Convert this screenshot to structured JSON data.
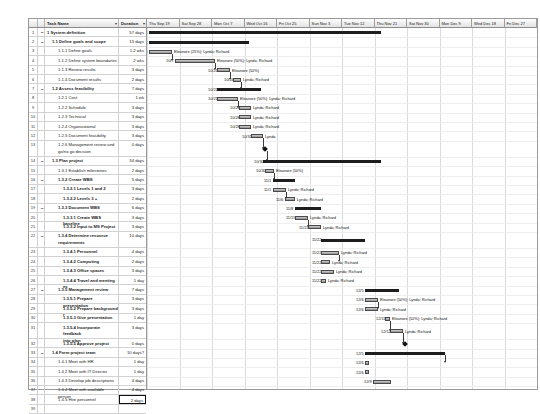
{
  "columns": {
    "id": "",
    "name": "Task Name",
    "duration": "Duration",
    "filter_icon": "▾"
  },
  "timeline": {
    "headers": [
      "Thu Sep 19",
      "Sat Sep 28",
      "Mon Oct 7",
      "Wed Oct 16",
      "Fri Oct 25",
      "Sun Nov 3",
      "Tue Nov 12",
      "Thu Nov 21",
      "Sat Nov 30",
      "Mon Dec 9",
      "Wed Dec 18",
      "Fri Dec 27"
    ]
  },
  "selected_row": 38,
  "tasks": [
    {
      "id": "1",
      "name": "1 System definition",
      "duration": "57 days",
      "level": 1,
      "summary": true,
      "collapse": true
    },
    {
      "id": "2",
      "name": "1.1 Define goals and scope",
      "duration": "15 days",
      "level": 2,
      "summary": true,
      "collapse": true
    },
    {
      "id": "3",
      "name": "1.1.1 Define goals",
      "duration": "1.2 wks",
      "level": 3
    },
    {
      "id": "4",
      "name": "1.1.2 Define system boundaries",
      "duration": "2 wks",
      "level": 3
    },
    {
      "id": "5",
      "name": "1.1.3 Review results",
      "duration": "3 days",
      "level": 3
    },
    {
      "id": "6",
      "name": "1.1.4 Document results",
      "duration": "2 days",
      "level": 3
    },
    {
      "id": "7",
      "name": "1.2 Assess feasibility",
      "duration": "7 days",
      "level": 2,
      "summary": true,
      "collapse": true
    },
    {
      "id": "8",
      "name": "1.2.1 Cost",
      "duration": "1 wk",
      "level": 3
    },
    {
      "id": "9",
      "name": "1.2.2 Schedule",
      "duration": "3 days",
      "level": 3
    },
    {
      "id": "10",
      "name": "1.2.3 Technical",
      "duration": "3 days",
      "level": 3
    },
    {
      "id": "11",
      "name": "1.2.4 Organizational",
      "duration": "3 days",
      "level": 3
    },
    {
      "id": "12",
      "name": "1.2.5 Document feasibility",
      "duration": "3 days",
      "level": 3
    },
    {
      "id": "13",
      "name": "1.2.6 Management review and\ngo/no go decision",
      "duration": "0 days",
      "level": 3,
      "tall": true
    },
    {
      "id": "14",
      "name": "1.3 Plan project",
      "duration": "34 days",
      "level": 2,
      "summary": true,
      "collapse": true
    },
    {
      "id": "15",
      "name": "1.3.1 Establish milestones",
      "duration": "2 days",
      "level": 3
    },
    {
      "id": "16",
      "name": "1.3.2 Create WBS",
      "duration": "5 days",
      "level": 3,
      "summary": true,
      "collapse": true
    },
    {
      "id": "17",
      "name": "1.3.2.1 Levels 1 and 2",
      "duration": "3 days",
      "level": 4
    },
    {
      "id": "18",
      "name": "1.3.2.2 Levels 3 +",
      "duration": "2 days",
      "level": 4
    },
    {
      "id": "19",
      "name": "1.3.3 Document WBS",
      "duration": "6 days",
      "level": 3,
      "summary": true,
      "collapse": true
    },
    {
      "id": "20",
      "name": "1.3.3.1 Create WBS baseline",
      "duration": "3 days",
      "level": 4
    },
    {
      "id": "21",
      "name": "1.3.3.2 Input to MS Project",
      "duration": "3 days",
      "level": 4
    },
    {
      "id": "22",
      "name": "1.3.4 Determine resource\nrequirements",
      "duration": "10 days",
      "level": 3,
      "summary": true,
      "collapse": true,
      "tall": true
    },
    {
      "id": "23",
      "name": "1.3.4.1 Personnel",
      "duration": "4 days",
      "level": 4
    },
    {
      "id": "24",
      "name": "1.3.4.2 Computing",
      "duration": "2 days",
      "level": 4
    },
    {
      "id": "25",
      "name": "1.3.4.3 Office spaces",
      "duration": "3 days",
      "level": 4
    },
    {
      "id": "26",
      "name": "1.3.4.4 Travel and meeting ex",
      "duration": "1 day",
      "level": 4
    },
    {
      "id": "27",
      "name": "1.3.5 Management review",
      "duration": "7 days",
      "level": 3,
      "summary": true,
      "collapse": true
    },
    {
      "id": "28",
      "name": "1.3.5.1 Prepare presentation",
      "duration": "3 days",
      "level": 4
    },
    {
      "id": "29",
      "name": "1.3.5.2 Prepare background r",
      "duration": "3 days",
      "level": 4
    },
    {
      "id": "30",
      "name": "1.3.5.3 Give presentation",
      "duration": "1 day",
      "level": 4
    },
    {
      "id": "31",
      "name": "1.3.5.4 Incorporate feedback\ninto plan",
      "duration": "3 days",
      "level": 4,
      "tall": true
    },
    {
      "id": "32",
      "name": "1.3.5.5 Approve project",
      "duration": "0 days",
      "level": 4
    },
    {
      "id": "33",
      "name": "1.4 Form project team",
      "duration": "10 days?",
      "level": 2,
      "summary": true,
      "collapse": true
    },
    {
      "id": "34",
      "name": "1.4.1 Meet with HR",
      "duration": "1 day",
      "level": 3
    },
    {
      "id": "35",
      "name": "1.4.2 Meet with IT Director",
      "duration": "1 day",
      "level": 3
    },
    {
      "id": "36",
      "name": "1.4.3 Develop job descriptions",
      "duration": "4 days",
      "level": 3
    },
    {
      "id": "37",
      "name": "1.4.4 Meet with available person",
      "duration": "4 days",
      "level": 3
    },
    {
      "id": "38",
      "name": "1.4.5 Hire personnel",
      "duration": "2 days",
      "level": 3,
      "selected": true
    },
    {
      "id": "39",
      "name": "",
      "duration": "",
      "level": 3
    }
  ],
  "bars": [
    {
      "row": 0,
      "type": "summary",
      "x": 2,
      "w": 232,
      "start": "10/1"
    },
    {
      "row": 1,
      "type": "summary",
      "x": 2,
      "w": 100,
      "start": "10/1"
    },
    {
      "row": 2,
      "type": "bar",
      "x": 2,
      "w": 23,
      "start": "10/1",
      "resources": "Eleanore (25%); Lynda; Richard"
    },
    {
      "row": 3,
      "type": "bar",
      "x": 28,
      "w": 40,
      "start": "10/7",
      "resources": "Eleanore (50%); Lynda; Richard"
    },
    {
      "row": 4,
      "type": "bar",
      "x": 70,
      "w": 13,
      "start": "10/21",
      "resources": "Eleanore (50%)"
    },
    {
      "row": 5,
      "type": "bar",
      "x": 86,
      "w": 8,
      "start": "10/24",
      "resources": "Lynda; Richard"
    },
    {
      "row": 6,
      "type": "summary",
      "x": 70,
      "w": 44,
      "start": "10/21"
    },
    {
      "row": 7,
      "type": "bar",
      "x": 70,
      "w": 21,
      "start": "10/21",
      "resources": "Eleanore (50%); Lynda; Richard"
    },
    {
      "row": 8,
      "type": "bar",
      "x": 92,
      "w": 12,
      "start": "10/28",
      "resources": "Lynda; Richard"
    },
    {
      "row": 9,
      "type": "bar",
      "x": 92,
      "w": 12,
      "start": "10/28",
      "resources": "Lynda; Richard"
    },
    {
      "row": 10,
      "type": "bar",
      "x": 92,
      "w": 12,
      "start": "10/28",
      "resources": "Lynda; Richard"
    },
    {
      "row": 11,
      "type": "bar",
      "x": 104,
      "w": 12,
      "start": "10/31",
      "resources": "Lynda"
    },
    {
      "row": 12,
      "type": "milestone",
      "x": 116,
      "start": ""
    },
    {
      "row": 13,
      "type": "summary",
      "x": 116,
      "w": 118,
      "start": "10/30"
    },
    {
      "row": 14,
      "type": "bar",
      "x": 118,
      "w": 9,
      "start": "10/30",
      "resources": "Eleanore (50%)"
    },
    {
      "row": 15,
      "type": "summary",
      "x": 126,
      "w": 22,
      "start": "11/1"
    },
    {
      "row": 16,
      "type": "bar",
      "x": 126,
      "w": 13,
      "start": "11/1",
      "resources": "Lynda; Richard"
    },
    {
      "row": 17,
      "type": "bar",
      "x": 138,
      "w": 10,
      "start": "11/6",
      "resources": "Lynda; Richard"
    },
    {
      "row": 18,
      "type": "summary",
      "x": 148,
      "w": 26,
      "start": "11/8"
    },
    {
      "row": 19,
      "type": "bar",
      "x": 148,
      "w": 13,
      "start": "11/15",
      "resources": "Lynda; Richard"
    },
    {
      "row": 20,
      "type": "bar",
      "x": 161,
      "w": 13,
      "start": "11/15",
      "resources": "Lynda; Richard"
    },
    {
      "row": 21,
      "type": "summary",
      "x": 174,
      "w": 44,
      "start": "11/22"
    },
    {
      "row": 22,
      "type": "bar",
      "x": 174,
      "w": 18,
      "start": "11/22",
      "resources": "Lynda; Richard"
    },
    {
      "row": 23,
      "type": "bar",
      "x": 174,
      "w": 9,
      "start": "11/22",
      "resources": "Lynda; Richard"
    },
    {
      "row": 24,
      "type": "bar",
      "x": 174,
      "w": 13,
      "start": "11/22",
      "resources": "Lynda; Richard"
    },
    {
      "row": 25,
      "type": "bar",
      "x": 174,
      "w": 5,
      "start": "11/22",
      "resources": "Lynda; Richard"
    },
    {
      "row": 26,
      "type": "summary",
      "x": 218,
      "w": 34,
      "start": "12/5"
    },
    {
      "row": 27,
      "type": "bar",
      "x": 218,
      "w": 13,
      "start": "12/6",
      "resources": "Eleanore (50%); Lynda; Richard"
    },
    {
      "row": 28,
      "type": "bar",
      "x": 218,
      "w": 13,
      "start": "12/6",
      "resources": "Lynda; Richard"
    },
    {
      "row": 29,
      "type": "bar",
      "x": 238,
      "w": 5,
      "start": "12/11",
      "resources": "Eleanore (50%); Lynda; Richard"
    },
    {
      "row": 30,
      "type": "bar",
      "x": 243,
      "w": 13,
      "start": "12/12",
      "resources": "Lynda; Richard"
    },
    {
      "row": 31,
      "type": "milestone",
      "x": 256,
      "start": ""
    },
    {
      "row": 32,
      "type": "summary",
      "x": 218,
      "w": 80,
      "start": "12/5"
    },
    {
      "row": 33,
      "type": "bar",
      "x": 218,
      "w": 4,
      "start": "12/6"
    },
    {
      "row": 34,
      "type": "bar",
      "x": 218,
      "w": 4,
      "start": "12/6"
    },
    {
      "row": 35,
      "type": "bar",
      "x": 226,
      "w": 18,
      "start": "12/9"
    },
    {
      "row": 36,
      "type": "bar",
      "x": 244,
      "w": 18,
      "start": "12/13"
    },
    {
      "row": 37,
      "type": "bar",
      "x": 262,
      "w": 10,
      "start": "12/18"
    }
  ]
}
